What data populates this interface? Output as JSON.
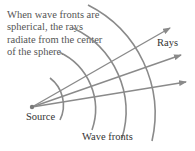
{
  "diagram": {
    "caption": "When wave fronts are spherical, the rays radiate from the center of the sphere.",
    "labels": {
      "source": "Source",
      "wave_fronts": "Wave fronts",
      "rays": "Rays"
    },
    "colors": {
      "stroke": "#8a8a8a",
      "text": "#3a3a3a"
    },
    "wave_front_count": 4,
    "ray_count": 3
  }
}
